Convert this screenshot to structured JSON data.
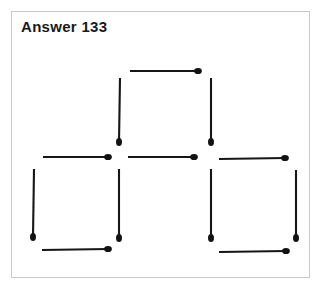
{
  "page": {
    "title": "Answer 133",
    "background_color": "#ffffff",
    "frame_border_color": "#c9c9c9"
  },
  "puzzle": {
    "name": "matchstick-puzzle-answer",
    "description": "Three squares formed from matchsticks: one square on top centre, two squares side by side below",
    "stick_color": "#161616",
    "head_color": "#121212",
    "square_count": 3,
    "stick_count": 11,
    "matchsticks": [
      {
        "id": "top-square-top",
        "orientation": "horizontal",
        "x1": 130,
        "y1": 71,
        "x2": 198,
        "y2": 71,
        "head": "end"
      },
      {
        "id": "top-square-left",
        "orientation": "vertical",
        "x1": 120,
        "y1": 78,
        "x2": 119,
        "y2": 142,
        "head": "end"
      },
      {
        "id": "top-square-right",
        "orientation": "vertical",
        "x1": 211,
        "y1": 78,
        "x2": 211,
        "y2": 142,
        "head": "end"
      },
      {
        "id": "middle-left",
        "orientation": "horizontal",
        "x1": 43,
        "y1": 157,
        "x2": 108,
        "y2": 157,
        "head": "end"
      },
      {
        "id": "middle-centre",
        "orientation": "horizontal",
        "x1": 128,
        "y1": 157,
        "x2": 194,
        "y2": 157,
        "head": "end"
      },
      {
        "id": "middle-right",
        "orientation": "horizontal",
        "x1": 219,
        "y1": 159,
        "x2": 285,
        "y2": 158,
        "head": "end"
      },
      {
        "id": "bottom-left-left",
        "orientation": "vertical",
        "x1": 34,
        "y1": 169,
        "x2": 33,
        "y2": 237,
        "head": "end"
      },
      {
        "id": "bottom-left-right",
        "orientation": "vertical",
        "x1": 119,
        "y1": 169,
        "x2": 119,
        "y2": 238,
        "head": "end"
      },
      {
        "id": "bottom-left-bottom",
        "orientation": "horizontal",
        "x1": 42,
        "y1": 250,
        "x2": 108,
        "y2": 249,
        "head": "end"
      },
      {
        "id": "bottom-right-left",
        "orientation": "vertical",
        "x1": 211,
        "y1": 169,
        "x2": 211,
        "y2": 238,
        "head": "end"
      },
      {
        "id": "bottom-right-right",
        "orientation": "vertical",
        "x1": 296,
        "y1": 170,
        "x2": 296,
        "y2": 238,
        "head": "end"
      },
      {
        "id": "bottom-right-bottom",
        "orientation": "horizontal",
        "x1": 219,
        "y1": 252,
        "x2": 286,
        "y2": 251,
        "head": "end"
      }
    ]
  }
}
